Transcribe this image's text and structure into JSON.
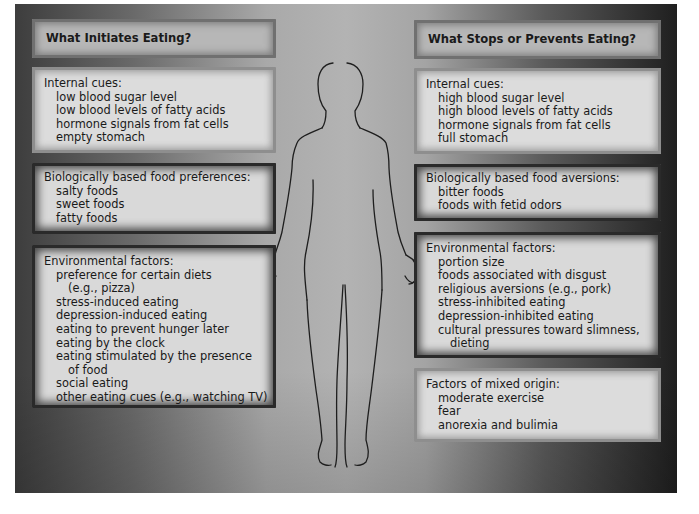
{
  "left": {
    "title": "What Initiates Eating?",
    "internal": {
      "heading": "Internal cues:",
      "items": [
        "low blood sugar level",
        "low blood levels of fatty acids",
        "hormone signals from fat cells",
        "empty stomach"
      ]
    },
    "biological": {
      "heading": "Biologically based food preferences:",
      "items": [
        "salty foods",
        "sweet foods",
        "fatty foods"
      ]
    },
    "environmental": {
      "heading": "Environmental factors:",
      "items": [
        "preference for certain diets",
        "(e.g., pizza)",
        "stress-induced eating",
        "depression-induced eating",
        "eating to prevent hunger later",
        "eating by the clock",
        "eating stimulated by the presence",
        "of food",
        "social eating",
        "other eating cues (e.g., watching TV)"
      ]
    }
  },
  "right": {
    "title": "What Stops or Prevents Eating?",
    "internal": {
      "heading": "Internal cues:",
      "items": [
        "high blood sugar level",
        "high blood levels of fatty acids",
        "hormone signals from fat cells",
        "full stomach"
      ]
    },
    "biological": {
      "heading": "Biologically based food aversions:",
      "items": [
        "bitter foods",
        "foods with fetid odors"
      ]
    },
    "environmental": {
      "heading": "Environmental factors:",
      "items": [
        "portion size",
        "foods associated with disgust",
        "religious aversions (e.g., pork)",
        "stress-inhibited eating",
        "depression-inhibited eating",
        "cultural pressures toward slimness,",
        "dieting"
      ]
    },
    "mixed": {
      "heading": "Factors of mixed origin:",
      "items": [
        "moderate exercise",
        "fear",
        "anorexia and bulimia"
      ]
    }
  },
  "figure": {
    "icon": "human-silhouette-icon"
  },
  "colors": {
    "panel_left": "#3d3d3d",
    "panel_center": "#b3b3b3",
    "panel_right": "#1f1f1f",
    "box_fill": "#dcdcdc",
    "text": "#1a1a1a"
  }
}
